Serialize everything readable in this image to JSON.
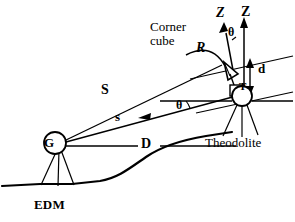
{
  "figure": {
    "background_color": "#ffffff",
    "stroke_color": "#000000"
  },
  "labels": {
    "corner_cube_line1": "Corner",
    "corner_cube_line2": "cube",
    "slant_range_R": "R",
    "zenith_prime": "Z",
    "zenith": "Z",
    "angle_theta_top": "θ",
    "offset_d": "d",
    "theodolite_point": "T",
    "slope_distance_S": "S",
    "slope_distance_s": "s",
    "angle_theta_bottom": "θ",
    "horizontal_distance_D": "D",
    "edm_point": "G",
    "edm_station": "EDM",
    "theodolite_station": "Theodolite"
  },
  "elements": {
    "edm_marker": "circle-with-G",
    "theodolite_marker": "circle-with-T",
    "corner_cube_marker": "triangular-prism",
    "ground_profile": "terrain-curve",
    "edm_tripod": "tripod-legs",
    "theodolite_tripod": "tripod-legs",
    "zenith_axis_arrow": "up-arrow",
    "zenith_prime_axis_arrow": "tilted-up-arrow",
    "d_dimension_arrow": "double-headed-arrow",
    "s_direction_arrow": "left-arrowhead",
    "R_curve": "curved-leader-line"
  },
  "geometry_notes": {
    "S_description": "slope distance from EDM G to corner cube",
    "s_description": "slope distance from EDM G to theodolite T",
    "D_description": "horizontal distance from G to theodolite vertical",
    "d_description": "vertical offset between corner cube and theodolite",
    "theta_description": "vertical/zenith angle"
  }
}
